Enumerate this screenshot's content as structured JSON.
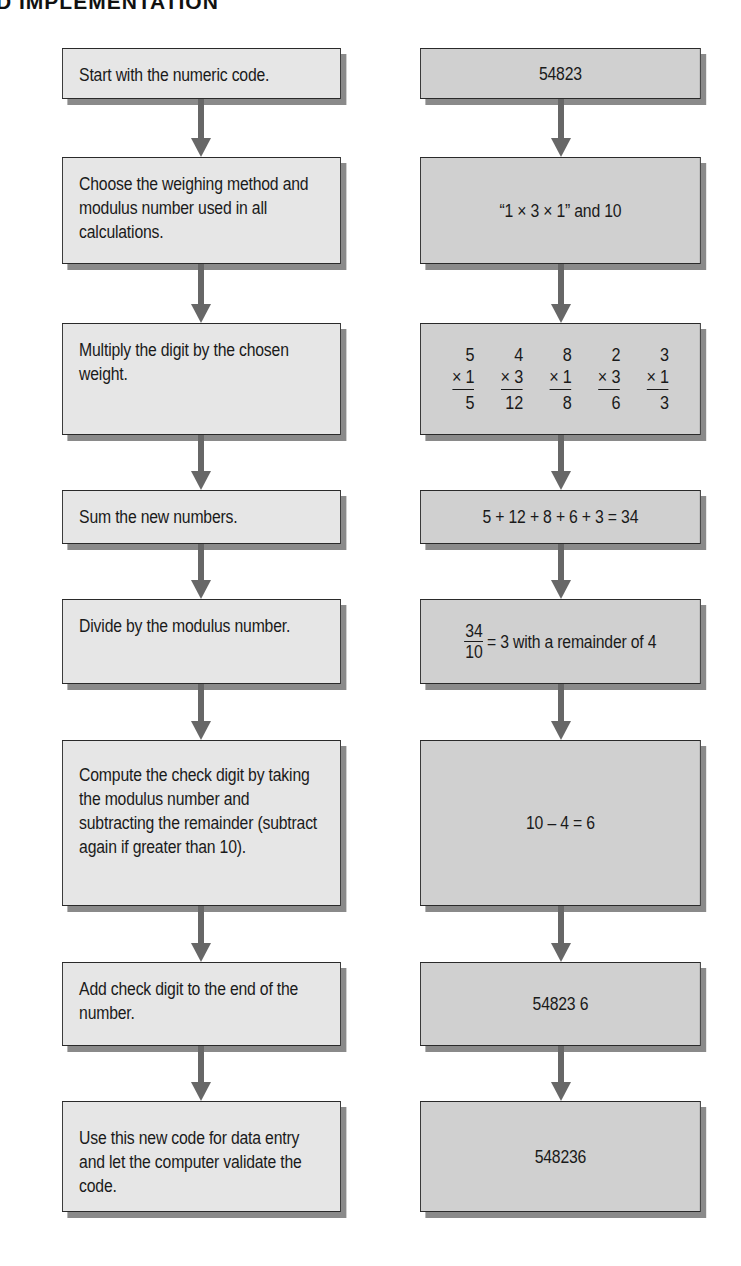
{
  "header": {
    "title": "D IMPLEMENTATION"
  },
  "colors": {
    "left_box_fill": "#e6e6e6",
    "right_box_fill": "#d0d0d0",
    "arrow": "#676767",
    "border": "#2a2a2a",
    "shadow": "#8a8a8a"
  },
  "steps": [
    {
      "text": "Start with the numeric code."
    },
    {
      "text": "Choose the weighing method and modulus number used in all calculations."
    },
    {
      "text": "Multiply the digit by the chosen weight."
    },
    {
      "text": "Sum the new numbers."
    },
    {
      "text": "Divide by the modulus number."
    },
    {
      "text": "Compute the check digit by taking the modulus number and subtracting the remainder (subtract again if greater than 10)."
    },
    {
      "text": "Add check digit to the end of the number."
    },
    {
      "text": "Use this new code for data entry and let the computer validate the code."
    }
  ],
  "examples": {
    "code": "54823",
    "method": "“1 × 3 × 1” and 10",
    "multiplications": [
      {
        "digit": "5",
        "weight": "× 1",
        "product": "5"
      },
      {
        "digit": "4",
        "weight": "× 3",
        "product": "12"
      },
      {
        "digit": "8",
        "weight": "× 1",
        "product": "8"
      },
      {
        "digit": "2",
        "weight": "× 3",
        "product": "6"
      },
      {
        "digit": "3",
        "weight": "× 1",
        "product": "3"
      }
    ],
    "sum": "5 + 12 + 8 + 6 + 3 = 34",
    "division": {
      "numerator": "34",
      "denominator": "10",
      "result": "= 3 with a remainder of 4"
    },
    "check_digit": "10 – 4 = 6",
    "appended": "54823 6",
    "final_code": "548236"
  }
}
